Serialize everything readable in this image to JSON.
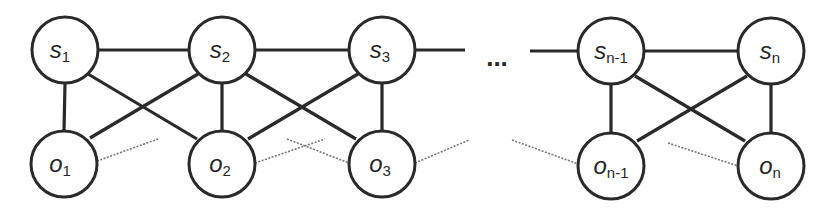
{
  "diagram": {
    "type": "graph",
    "ellipsis": "...",
    "nodes": [
      {
        "id": "s1",
        "base": "s",
        "sub": "1",
        "x": 65,
        "y": 50
      },
      {
        "id": "s2",
        "base": "s",
        "sub": "2",
        "x": 222,
        "y": 50
      },
      {
        "id": "s3",
        "base": "s",
        "sub": "3",
        "x": 382,
        "y": 50
      },
      {
        "id": "sn1",
        "base": "s",
        "sub": "n-1",
        "x": 611,
        "y": 51
      },
      {
        "id": "sn",
        "base": "s",
        "sub": "n",
        "x": 771,
        "y": 51
      },
      {
        "id": "o1",
        "base": "o",
        "sub": "1",
        "x": 64,
        "y": 164
      },
      {
        "id": "o2",
        "base": "o",
        "sub": "2",
        "x": 222,
        "y": 164
      },
      {
        "id": "o3",
        "base": "o",
        "sub": "3",
        "x": 382,
        "y": 164
      },
      {
        "id": "on1",
        "base": "o",
        "sub": "n-1",
        "x": 611,
        "y": 166
      },
      {
        "id": "on",
        "base": "o",
        "sub": "n",
        "x": 771,
        "y": 166
      }
    ],
    "edges_solid": [
      [
        "s1",
        "s2"
      ],
      [
        "s2",
        "s3"
      ],
      [
        "sn1",
        "sn"
      ],
      [
        "s1",
        "o1"
      ],
      [
        "s2",
        "o2"
      ],
      [
        "s3",
        "o3"
      ],
      [
        "sn1",
        "on1"
      ],
      [
        "sn",
        "on"
      ],
      [
        "s1",
        "o2"
      ],
      [
        "s2",
        "o1"
      ],
      [
        "s2",
        "o3"
      ],
      [
        "s3",
        "o2"
      ],
      [
        "sn1",
        "on"
      ],
      [
        "sn",
        "on1"
      ]
    ],
    "edges_dotted_note": "faint dotted lines between observation nodes"
  }
}
